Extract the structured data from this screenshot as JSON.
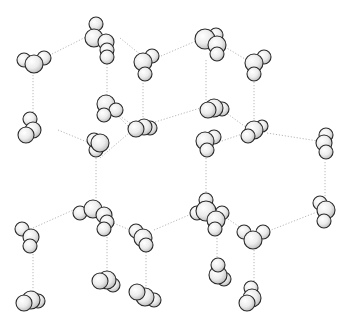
{
  "diagram": {
    "background": "#ffffff",
    "colors": {
      "atom_highlight": "#ffffff",
      "atom_mid": "#ececec",
      "atom_shadow": "#b9b9b9",
      "atom_outline": "#2a2a2a",
      "bond": "#b8b8b8"
    },
    "molecules": [
      {
        "id": "m1",
        "atoms": [
          [
            24,
            60,
            7
          ],
          [
            44,
            58,
            7
          ],
          [
            34,
            64,
            9
          ]
        ]
      },
      {
        "id": "m2",
        "atoms": [
          [
            96,
            24,
            7
          ],
          [
            94,
            38,
            9
          ],
          [
            106,
            42,
            8
          ],
          [
            107,
            50,
            7
          ],
          [
            107,
            57,
            7
          ]
        ]
      },
      {
        "id": "m3",
        "atoms": [
          [
            152,
            56,
            7
          ],
          [
            143,
            62,
            9
          ],
          [
            145,
            74,
            7
          ]
        ]
      },
      {
        "id": "m4",
        "atoms": [
          [
            216,
            35,
            7
          ],
          [
            205,
            39,
            10
          ],
          [
            217,
            45,
            9
          ],
          [
            217,
            54,
            7
          ]
        ]
      },
      {
        "id": "m5",
        "atoms": [
          [
            264,
            57,
            7
          ],
          [
            254,
            63,
            9
          ],
          [
            254,
            74,
            7
          ]
        ]
      },
      {
        "id": "m6",
        "atoms": [
          [
            30,
            119,
            7
          ],
          [
            33,
            130,
            8
          ],
          [
            26,
            135,
            8
          ]
        ]
      },
      {
        "id": "m7",
        "atoms": [
          [
            106,
            104,
            9
          ],
          [
            116,
            110,
            7
          ],
          [
            104,
            115,
            7
          ]
        ]
      },
      {
        "id": "m8",
        "atoms": [
          [
            150,
            128,
            7
          ],
          [
            144,
            127,
            8
          ],
          [
            136,
            129,
            8
          ]
        ]
      },
      {
        "id": "m9",
        "atoms": [
          [
            96,
            150,
            7
          ],
          [
            94,
            140,
            7
          ],
          [
            100,
            143,
            9
          ]
        ]
      },
      {
        "id": "m10",
        "atoms": [
          [
            222,
            109,
            7
          ],
          [
            214,
            108,
            9
          ],
          [
            208,
            110,
            8
          ]
        ]
      },
      {
        "id": "m11",
        "atoms": [
          [
            214,
            137,
            7
          ],
          [
            205,
            141,
            9
          ],
          [
            207,
            150,
            7
          ]
        ]
      },
      {
        "id": "m12",
        "atoms": [
          [
            262,
            126,
            6
          ],
          [
            254,
            130,
            9
          ],
          [
            248,
            136,
            7
          ]
        ]
      },
      {
        "id": "m13",
        "atoms": [
          [
            326,
            135,
            7
          ],
          [
            324,
            143,
            8
          ],
          [
            326,
            152,
            7
          ]
        ]
      },
      {
        "id": "m14",
        "atoms": [
          [
            80,
            213,
            7
          ],
          [
            93,
            209,
            9
          ],
          [
            104,
            215,
            8
          ],
          [
            107,
            222,
            7
          ],
          [
            104,
            229,
            7
          ]
        ]
      },
      {
        "id": "m15",
        "atoms": [
          [
            136,
            231,
            7
          ],
          [
            143,
            238,
            9
          ],
          [
            146,
            245,
            7
          ]
        ]
      },
      {
        "id": "m16",
        "atoms": [
          [
            22,
            229,
            7
          ],
          [
            31,
            237,
            8
          ],
          [
            30,
            246,
            7
          ]
        ]
      },
      {
        "id": "m17",
        "atoms": [
          [
            206,
            200,
            7
          ],
          [
            197,
            213,
            7
          ],
          [
            222,
            213,
            7
          ],
          [
            206,
            211,
            10
          ],
          [
            216,
            220,
            9
          ],
          [
            215,
            229,
            7
          ]
        ]
      },
      {
        "id": "m18",
        "atoms": [
          [
            244,
            232,
            7
          ],
          [
            263,
            232,
            7
          ],
          [
            253,
            240,
            9
          ]
        ]
      },
      {
        "id": "m19",
        "atoms": [
          [
            320,
            203,
            7
          ],
          [
            326,
            210,
            9
          ],
          [
            324,
            221,
            7
          ]
        ]
      },
      {
        "id": "m20",
        "atoms": [
          [
            38,
            301,
            7
          ],
          [
            31,
            300,
            9
          ],
          [
            24,
            303,
            8
          ]
        ]
      },
      {
        "id": "m21",
        "atoms": [
          [
            113,
            285,
            7
          ],
          [
            107,
            280,
            9
          ],
          [
            100,
            281,
            8
          ]
        ]
      },
      {
        "id": "m22",
        "atoms": [
          [
            154,
            300,
            7
          ],
          [
            145,
            297,
            9
          ],
          [
            137,
            292,
            8
          ]
        ]
      },
      {
        "id": "m23",
        "atoms": [
          [
            224,
            279,
            7
          ],
          [
            218,
            275,
            9
          ],
          [
            218,
            265,
            7
          ]
        ]
      },
      {
        "id": "m24",
        "atoms": [
          [
            251,
            288,
            7
          ],
          [
            252,
            298,
            9
          ],
          [
            247,
            303,
            8
          ]
        ]
      }
    ],
    "bonds": [
      [
        44,
        58,
        88,
        36
      ],
      [
        33,
        72,
        33,
        117
      ],
      [
        58,
        130,
        87,
        142
      ],
      [
        120,
        38,
        141,
        55
      ],
      [
        107,
        64,
        107,
        101
      ],
      [
        117,
        114,
        134,
        126
      ],
      [
        155,
        122,
        207,
        106
      ],
      [
        143,
        80,
        143,
        120
      ],
      [
        161,
        56,
        203,
        38
      ],
      [
        225,
        47,
        250,
        62
      ],
      [
        206,
        60,
        206,
        104
      ],
      [
        254,
        82,
        254,
        123
      ],
      [
        219,
        142,
        248,
        132
      ],
      [
        267,
        133,
        318,
        141
      ],
      [
        100,
        158,
        136,
        127
      ],
      [
        96,
        158,
        96,
        200
      ],
      [
        33,
        228,
        80,
        207
      ],
      [
        111,
        222,
        130,
        230
      ],
      [
        154,
        230,
        196,
        212
      ],
      [
        206,
        152,
        206,
        198
      ],
      [
        228,
        219,
        244,
        230
      ],
      [
        266,
        232,
        317,
        212
      ],
      [
        325,
        162,
        325,
        198
      ],
      [
        33,
        254,
        33,
        292
      ],
      [
        107,
        237,
        107,
        272
      ],
      [
        146,
        252,
        146,
        287
      ],
      [
        217,
        235,
        217,
        258
      ],
      [
        254,
        250,
        254,
        283
      ],
      [
        110,
        108,
        130,
        128
      ],
      [
        225,
        112,
        247,
        128
      ]
    ]
  }
}
